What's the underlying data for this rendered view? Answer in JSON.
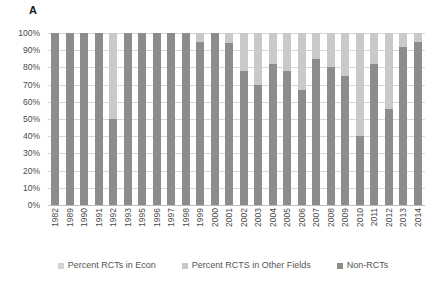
{
  "panel": {
    "label": "A"
  },
  "chart_data": {
    "type": "bar",
    "subtype": "100-percent-stacked-bar",
    "title": "",
    "xlabel": "",
    "ylabel": "",
    "ylim": [
      0,
      100
    ],
    "ytick_labels": [
      "100%",
      "90%",
      "80%",
      "70%",
      "60%",
      "50%",
      "40%",
      "30%",
      "20%",
      "10%",
      "0%"
    ],
    "ytick_values": [
      100,
      90,
      80,
      70,
      60,
      50,
      40,
      30,
      20,
      10,
      0
    ],
    "grid": true,
    "legend_position": "bottom",
    "categories": [
      "1982",
      "1989",
      "1990",
      "1991",
      "1992",
      "1993",
      "1995",
      "1996",
      "1997",
      "1998",
      "1999",
      "2000",
      "2001",
      "2002",
      "2003",
      "2004",
      "2005",
      "2006",
      "2007",
      "2008",
      "2009",
      "2010",
      "2011",
      "2012",
      "2013",
      "2014"
    ],
    "series": [
      {
        "name": "Percent RCTs in Econ",
        "color": "#d3d3d3",
        "values": [
          0,
          0,
          0,
          0,
          0,
          0,
          0,
          0,
          0,
          0,
          0,
          0,
          0,
          0,
          0,
          0,
          0,
          0,
          0,
          0,
          0,
          0,
          0,
          0,
          0,
          0
        ]
      },
      {
        "name": "Percent RCTS in Other Fields",
        "color": "#c9c9c9",
        "values": [
          0,
          0,
          0,
          0,
          50,
          0,
          0,
          0,
          0,
          0,
          5,
          0,
          6,
          22,
          30,
          18,
          22,
          33,
          15,
          20,
          25,
          60,
          18,
          44,
          8,
          5
        ]
      },
      {
        "name": "Non-RCTs",
        "color": "#8c8c8c",
        "values": [
          100,
          100,
          100,
          100,
          50,
          100,
          100,
          100,
          100,
          100,
          95,
          100,
          94,
          78,
          70,
          82,
          78,
          67,
          85,
          80,
          75,
          40,
          82,
          56,
          92,
          95
        ]
      }
    ]
  },
  "legend": {
    "items": [
      {
        "label": "Percent RCTs in Econ",
        "color": "#d3d3d3"
      },
      {
        "label": "Percent RCTS in Other Fields",
        "color": "#c9c9c9"
      },
      {
        "label": "Non-RCTs",
        "color": "#8c8c8c"
      }
    ]
  }
}
